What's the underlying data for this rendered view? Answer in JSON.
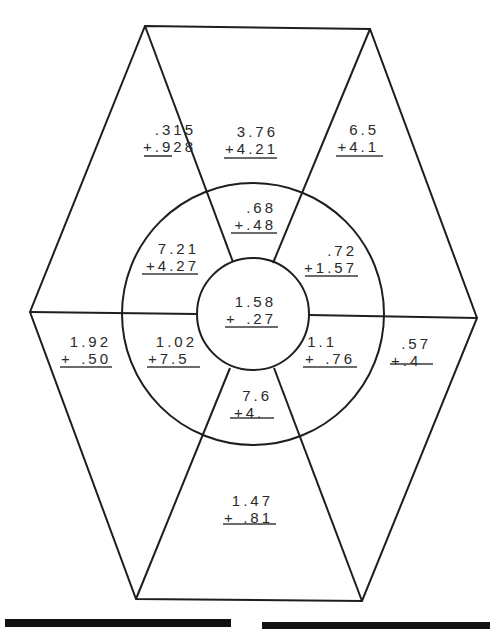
{
  "worksheet": {
    "shape": "hexagon with two concentric circles divided into addition problems",
    "problems": [
      {
        "id": "outer-top-left",
        "top": ".315",
        "bottom": "+.928",
        "x": 170,
        "y": 135
      },
      {
        "id": "outer-top",
        "top": "3.76",
        "bottom": "+4.21",
        "x": 275,
        "y": 135
      },
      {
        "id": "outer-top-right",
        "top": "6.5",
        "bottom": "+4.1",
        "x": 377,
        "y": 133
      },
      {
        "id": "middle-top",
        "top": ".68",
        "bottom": "+.48",
        "x": 275,
        "y": 213
      },
      {
        "id": "middle-top-left",
        "top": "7.21",
        "bottom": "+4.27",
        "x": 198,
        "y": 250
      },
      {
        "id": "middle-top-right",
        "top": ".72",
        "bottom": "+1.57",
        "x": 357,
        "y": 256
      },
      {
        "id": "center",
        "top": "1.58",
        "bottom": "+  .27",
        "x": 278,
        "y": 305
      },
      {
        "id": "outer-left",
        "top": "1.92",
        "bottom": "+  .50",
        "x": 112,
        "y": 345
      },
      {
        "id": "middle-left",
        "top": "1.02",
        "bottom": "+7.5",
        "x": 198,
        "y": 345
      },
      {
        "id": "middle-right",
        "top": "1.1",
        "bottom": "+  .76",
        "x": 356,
        "y": 345
      },
      {
        "id": "outer-right",
        "top": ".57",
        "bottom": "+.4",
        "x": 432,
        "y": 347
      },
      {
        "id": "middle-bottom",
        "top": "7.6",
        "bottom": "+4.",
        "x": 274,
        "y": 400
      },
      {
        "id": "outer-bottom",
        "top": "1.47",
        "bottom": "+  .81",
        "x": 275,
        "y": 503
      }
    ]
  }
}
